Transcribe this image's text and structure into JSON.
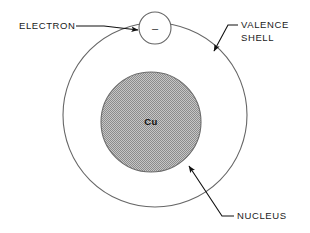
{
  "diagram": {
    "element_symbol": "Cu",
    "electron_charge_glyph": "–",
    "labels": {
      "electron": "ELECTRON",
      "valence_shell_line1": "VALENCE",
      "valence_shell_line2": "SHELL",
      "nucleus": "NUCLEUS"
    },
    "colors": {
      "background": "#ffffff",
      "stroke": "#555555",
      "leader_line": "#111111",
      "text": "#1a1a1a",
      "nucleus_fill": "#b4b4b4",
      "nucleus_pattern_dark": "#8f8f8f"
    },
    "geometry": {
      "valence_shell_center_x": 155,
      "valence_shell_center_y": 115,
      "valence_shell_radius": 92,
      "nucleus_center_x": 151,
      "nucleus_center_y": 122,
      "nucleus_radius": 50,
      "electron_center_x": 155,
      "electron_center_y": 28,
      "electron_radius": 16
    }
  }
}
